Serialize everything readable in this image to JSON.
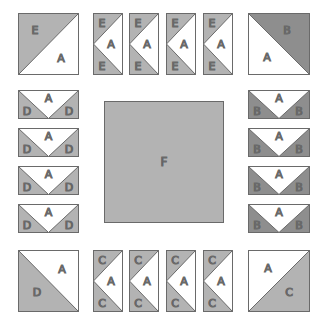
{
  "colors": {
    "light_fabric": "#b3b3b3",
    "dark_fabric": "#8e8e8e",
    "background_fabric": "#ffffff",
    "outline": "#6a6a6a"
  },
  "corners": {
    "top_left": {
      "dark": "E",
      "light": "A"
    },
    "top_right": {
      "dark": "B",
      "light": "A"
    },
    "bottom_left": {
      "dark": "D",
      "light": "A"
    },
    "bottom_right": {
      "dark": "C",
      "light": "A"
    }
  },
  "top_units": [
    {
      "top": "E",
      "middle": "A",
      "bottom": "E"
    },
    {
      "top": "E",
      "middle": "A",
      "bottom": "E"
    },
    {
      "top": "E",
      "middle": "A",
      "bottom": "E"
    },
    {
      "top": "E",
      "middle": "A",
      "bottom": "E"
    }
  ],
  "bottom_units": [
    {
      "top": "C",
      "middle": "A",
      "bottom": "C"
    },
    {
      "top": "C",
      "middle": "A",
      "bottom": "C"
    },
    {
      "top": "C",
      "middle": "A",
      "bottom": "C"
    },
    {
      "top": "C",
      "middle": "A",
      "bottom": "C"
    }
  ],
  "left_units": [
    {
      "left": "D",
      "middle": "A",
      "right": "D"
    },
    {
      "left": "D",
      "middle": "A",
      "right": "D"
    },
    {
      "left": "D",
      "middle": "A",
      "right": "D"
    },
    {
      "left": "D",
      "middle": "A",
      "right": "D"
    }
  ],
  "right_units": [
    {
      "left": "B",
      "middle": "A",
      "right": "B"
    },
    {
      "left": "B",
      "middle": "A",
      "right": "B"
    },
    {
      "left": "B",
      "middle": "A",
      "right": "B"
    },
    {
      "left": "B",
      "middle": "A",
      "right": "B"
    }
  ],
  "center": {
    "label": "F"
  }
}
